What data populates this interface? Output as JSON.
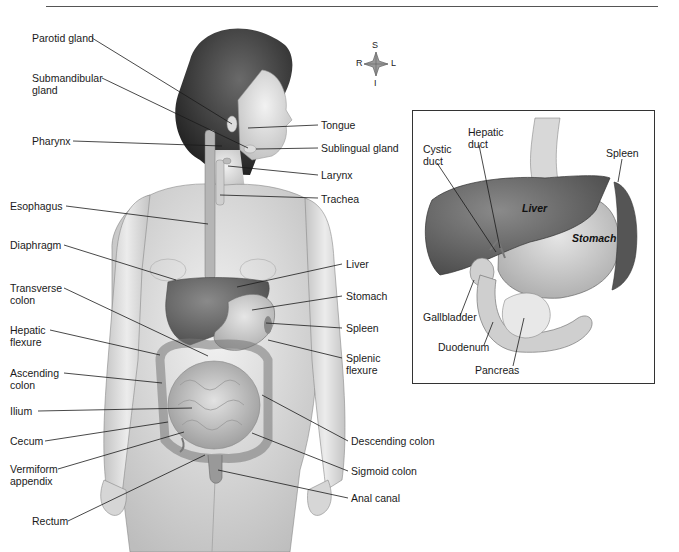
{
  "figure": {
    "header_fragment": "",
    "colors": {
      "liver": "#6e6e6e",
      "stomach": "#cfcfcf",
      "skin": "#e4e4e4",
      "hair": "#3a3a3a",
      "line": "#1a1a1a"
    }
  },
  "compass": {
    "top": "S",
    "left": "R",
    "right": "L",
    "bottom": "I"
  },
  "body_labels_left": [
    {
      "id": "parotid",
      "text": "Parotid gland"
    },
    {
      "id": "submandibular",
      "text": "Submandibular\ngland"
    },
    {
      "id": "pharynx",
      "text": "Pharynx"
    },
    {
      "id": "esophagus",
      "text": "Esophagus"
    },
    {
      "id": "diaphragm",
      "text": "Diaphragm"
    },
    {
      "id": "transverse",
      "text": "Transverse\ncolon"
    },
    {
      "id": "hepatic_flexure",
      "text": "Hepatic\nflexure"
    },
    {
      "id": "ascending",
      "text": "Ascending\ncolon"
    },
    {
      "id": "ilium",
      "text": "Ilium"
    },
    {
      "id": "cecum",
      "text": "Cecum"
    },
    {
      "id": "appendix",
      "text": "Vermiform\nappendix"
    },
    {
      "id": "rectum",
      "text": "Rectum"
    }
  ],
  "body_labels_right": [
    {
      "id": "tongue",
      "text": "Tongue"
    },
    {
      "id": "sublingual",
      "text": "Sublingual gland"
    },
    {
      "id": "larynx",
      "text": "Larynx"
    },
    {
      "id": "trachea",
      "text": "Trachea"
    },
    {
      "id": "liver",
      "text": "Liver"
    },
    {
      "id": "stomach",
      "text": "Stomach"
    },
    {
      "id": "spleen",
      "text": "Spleen"
    },
    {
      "id": "splenic_flexure",
      "text": "Splenic\nflexure"
    },
    {
      "id": "descending",
      "text": "Descending colon"
    },
    {
      "id": "sigmoid",
      "text": "Sigmoid colon"
    },
    {
      "id": "anal",
      "text": "Anal canal"
    }
  ],
  "inset": {
    "labels": [
      {
        "id": "cystic",
        "text": "Cystic\nduct"
      },
      {
        "id": "hepatic_duct",
        "text": "Hepatic\nduct"
      },
      {
        "id": "spleen",
        "text": "Spleen"
      },
      {
        "id": "gallbladder",
        "text": "Gallbladder"
      },
      {
        "id": "duodenum",
        "text": "Duodenum"
      },
      {
        "id": "pancreas",
        "text": "Pancreas"
      }
    ],
    "organ_text": {
      "liver": "Liver",
      "stomach": "Stomach"
    }
  }
}
